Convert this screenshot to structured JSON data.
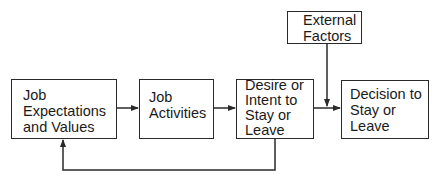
{
  "diagram": {
    "type": "flowchart",
    "nodes": {
      "job_expectations": {
        "label": "Job\nExpectations\nand Values"
      },
      "job_activities": {
        "label": "Job\nActivities"
      },
      "desire_intent": {
        "label": "Desire or\nIntent to\nStay or\nLeave"
      },
      "decision": {
        "label": "Decision to\nStay or\nLeave"
      },
      "external_factors": {
        "label": "External\nFactors"
      }
    },
    "edges": [
      {
        "from": "job_expectations",
        "to": "job_activities"
      },
      {
        "from": "job_activities",
        "to": "desire_intent"
      },
      {
        "from": "desire_intent",
        "to": "decision"
      },
      {
        "from": "external_factors",
        "to": "decision"
      },
      {
        "from": "desire_intent",
        "to": "job_expectations",
        "kind": "feedback"
      }
    ],
    "colors": {
      "line": "#2a2a2a",
      "background": "#ffffff",
      "text": "#1a1a1a"
    }
  }
}
